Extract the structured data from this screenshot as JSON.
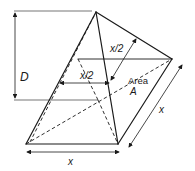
{
  "figure": {
    "labels": {
      "height": "D",
      "half_width_front": "x/2",
      "half_width_top": "x/2",
      "area_word": "Area",
      "area_symbol": "A",
      "base_width_bottom": "x",
      "base_width_side": "x"
    },
    "colors": {
      "line": "#1a1a1a",
      "background": "#ffffff"
    }
  }
}
